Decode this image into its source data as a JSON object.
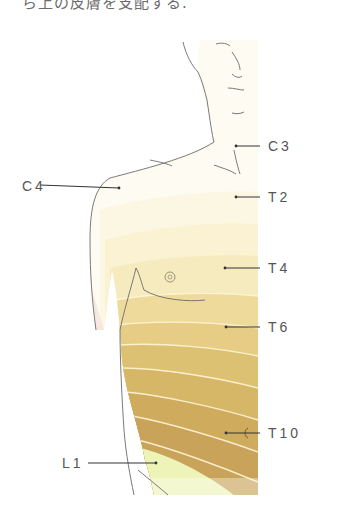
{
  "caption": "ら上の皮膚を支配する.",
  "figure": {
    "labels": [
      {
        "id": "c3",
        "text": "C3",
        "x": 268,
        "y": 137,
        "side": "right"
      },
      {
        "id": "c4",
        "text": "C4",
        "x": 24,
        "y": 178,
        "side": "left"
      },
      {
        "id": "t2",
        "text": "T2",
        "x": 268,
        "y": 188,
        "side": "right"
      },
      {
        "id": "t4",
        "text": "T4",
        "x": 268,
        "y": 259,
        "side": "right"
      },
      {
        "id": "t6",
        "text": "T6",
        "x": 268,
        "y": 318,
        "side": "right"
      },
      {
        "id": "t10",
        "text": "T10",
        "x": 268,
        "y": 425,
        "side": "right"
      },
      {
        "id": "l1",
        "text": "L1",
        "x": 62,
        "y": 457,
        "side": "left"
      }
    ],
    "colors": {
      "skin": "#fdfbf2",
      "outline": "#6b6b6b",
      "band_light": "#fbf3cf",
      "band_mid": "#e9cf86",
      "band_dark": "#c9a052",
      "l1_band": "#eef4b8",
      "band_line": "#fff6d6"
    }
  }
}
